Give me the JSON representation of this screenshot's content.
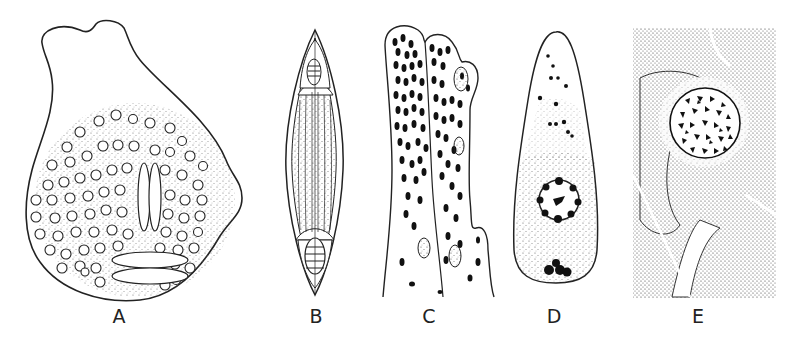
{
  "figure": {
    "panels": [
      {
        "id": "A",
        "label": "A",
        "description": "amoeboid cell with numerous small vacuoles, stippled cytoplasm and spindle bodies"
      },
      {
        "id": "B",
        "label": "B",
        "description": "fusiform spindle-shaped cell with longitudinal striations and end polar capsules"
      },
      {
        "id": "C",
        "label": "C",
        "description": "elongated branching cells densely packed with dark oval granules"
      },
      {
        "id": "D",
        "label": "D",
        "description": "teardrop-shaped cell with central nucleus and dark granular clusters"
      },
      {
        "id": "E",
        "label": "E",
        "description": "stippled tissue section with central nucleus filled with dark chromatin fragments"
      }
    ]
  }
}
